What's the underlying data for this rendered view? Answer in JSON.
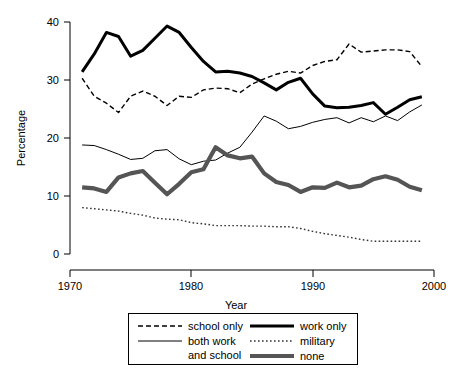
{
  "chart_data": {
    "type": "line",
    "title": "",
    "xlabel": "Year",
    "ylabel": "Percentage",
    "xlim": [
      1970,
      2000
    ],
    "ylim": [
      0,
      40
    ],
    "xticks": [
      1970,
      1980,
      1990,
      2000
    ],
    "yticks": [
      0,
      10,
      20,
      30,
      40
    ],
    "grid": false,
    "legend_position": "below",
    "x": [
      1971,
      1972,
      1973,
      1974,
      1975,
      1976,
      1977,
      1978,
      1979,
      1980,
      1981,
      1982,
      1983,
      1984,
      1985,
      1986,
      1987,
      1988,
      1989,
      1990,
      1991,
      1992,
      1993,
      1994,
      1995,
      1996,
      1997,
      1998,
      1999
    ],
    "series": [
      {
        "name": "school only",
        "style": "dashed",
        "color": "#000000",
        "width": 1.4,
        "values": [
          30.3,
          27.2,
          26.0,
          24.4,
          27.2,
          28.1,
          27.2,
          25.6,
          27.2,
          27.0,
          28.3,
          28.6,
          28.5,
          27.8,
          29.3,
          30.2,
          31.0,
          31.5,
          31.2,
          32.5,
          33.2,
          33.5,
          36.2,
          34.8,
          35.0,
          35.2,
          35.2,
          34.9,
          32.3
        ]
      },
      {
        "name": "both work and school",
        "style": "solid",
        "color": "#000000",
        "width": 1.0,
        "values": [
          18.8,
          18.7,
          18.0,
          17.2,
          16.3,
          16.5,
          17.8,
          18.0,
          16.4,
          15.4,
          16.0,
          16.2,
          17.4,
          18.4,
          21.0,
          23.8,
          22.9,
          21.6,
          22.0,
          22.7,
          23.2,
          23.5,
          22.6,
          23.5,
          22.8,
          23.8,
          23.0,
          24.5,
          25.7
        ]
      },
      {
        "name": "work only",
        "style": "solid",
        "color": "#000000",
        "width": 3.0,
        "values": [
          31.4,
          34.5,
          38.2,
          37.5,
          34.1,
          35.1,
          37.2,
          39.3,
          38.2,
          35.6,
          33.2,
          31.4,
          31.5,
          31.2,
          30.6,
          29.5,
          28.3,
          29.6,
          30.3,
          27.6,
          25.5,
          25.2,
          25.3,
          25.6,
          26.1,
          24.1,
          25.3,
          26.6,
          27.1
        ]
      },
      {
        "name": "military",
        "style": "dotted",
        "color": "#333333",
        "width": 1.4,
        "values": [
          8.0,
          7.8,
          7.6,
          7.4,
          7.0,
          6.7,
          6.2,
          6.0,
          5.9,
          5.4,
          5.2,
          4.9,
          4.9,
          4.9,
          4.8,
          4.8,
          4.7,
          4.7,
          4.4,
          3.9,
          3.5,
          3.2,
          2.9,
          2.5,
          2.2,
          2.2,
          2.2,
          2.2,
          2.2
        ]
      },
      {
        "name": "none",
        "style": "solid",
        "color": "#555555",
        "width": 4.2,
        "values": [
          11.5,
          11.3,
          10.7,
          13.2,
          13.9,
          14.3,
          12.3,
          10.3,
          12.1,
          14.1,
          14.6,
          18.4,
          17.0,
          16.5,
          16.8,
          13.9,
          12.4,
          11.9,
          10.7,
          11.5,
          11.4,
          12.3,
          11.5,
          11.8,
          12.9,
          13.4,
          12.8,
          11.6,
          11.0
        ]
      }
    ]
  },
  "axes": {
    "y_title": "Percentage",
    "x_title": "Year",
    "y_tick_labels": [
      "40",
      "30",
      "20",
      "10",
      "0"
    ],
    "x_tick_labels": [
      "1970",
      "1980",
      "1990",
      "2000"
    ]
  },
  "legend": {
    "entries": [
      {
        "label": "school only",
        "key": "school-only"
      },
      {
        "label": "both work",
        "key": "both-work-line1"
      },
      {
        "label": "and school",
        "key": "both-work-line2"
      },
      {
        "label": "work only",
        "key": "work-only"
      },
      {
        "label": "military",
        "key": "military"
      },
      {
        "label": "none",
        "key": "none"
      }
    ]
  }
}
